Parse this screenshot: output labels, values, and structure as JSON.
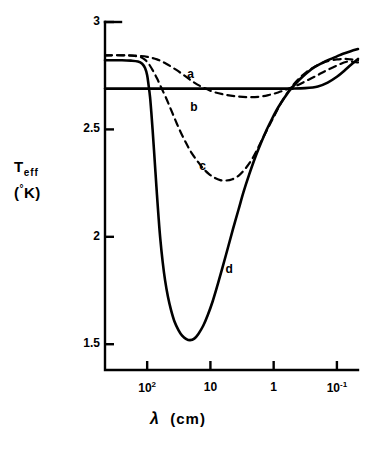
{
  "chart_data": {
    "type": "line",
    "title": "",
    "xlabel": "λ  (cm)",
    "ylabel": "T_eff (°K)",
    "xscale": "log",
    "x_axis_reversed": true,
    "xlim": [
      464.16,
      0.0464
    ],
    "ylim": [
      1.38,
      3.0
    ],
    "grid": false,
    "legend_position": "inline-curve-labels",
    "xticks": [
      {
        "value": 100,
        "label_base": "10",
        "label_exp": "2"
      },
      {
        "value": 10,
        "label_base": "10",
        "label_exp": ""
      },
      {
        "value": 1,
        "label_base": "1",
        "label_exp": ""
      },
      {
        "value": 0.1,
        "label_base": "10",
        "label_exp": "-1"
      }
    ],
    "yticks": [
      {
        "value": 3,
        "label": "3"
      },
      {
        "value": 2.5,
        "label": "2.5"
      },
      {
        "value": 2,
        "label": "2"
      },
      {
        "value": 1.5,
        "label": "1.5"
      }
    ],
    "series": [
      {
        "name": "a",
        "label": "a",
        "style": "solid",
        "label_x": 20,
        "label_y": 2.755,
        "points": [
          [
            464.16,
            2.69
          ],
          [
            100,
            2.69
          ],
          [
            30,
            2.69
          ],
          [
            10,
            2.69
          ],
          [
            3,
            2.69
          ],
          [
            1,
            2.69
          ],
          [
            0.5,
            2.69
          ],
          [
            0.32,
            2.692
          ],
          [
            0.2,
            2.7
          ],
          [
            0.14,
            2.718
          ],
          [
            0.1,
            2.745
          ],
          [
            0.075,
            2.775
          ],
          [
            0.0605,
            2.8
          ],
          [
            0.0464,
            2.828
          ]
        ]
      },
      {
        "name": "b",
        "label": "b",
        "style": "dashed",
        "label_x": 18,
        "label_y": 2.6,
        "points": [
          [
            464.16,
            2.845
          ],
          [
            200,
            2.845
          ],
          [
            140,
            2.843
          ],
          [
            100,
            2.838
          ],
          [
            70,
            2.826
          ],
          [
            50,
            2.806
          ],
          [
            35,
            2.778
          ],
          [
            25,
            2.748
          ],
          [
            18,
            2.718
          ],
          [
            13,
            2.695
          ],
          [
            9,
            2.675
          ],
          [
            6,
            2.662
          ],
          [
            4,
            2.654
          ],
          [
            2.6,
            2.65
          ],
          [
            1.7,
            2.652
          ],
          [
            1.2,
            2.66
          ],
          [
            0.85,
            2.672
          ],
          [
            0.6,
            2.688
          ],
          [
            0.42,
            2.706
          ],
          [
            0.3,
            2.727
          ],
          [
            0.21,
            2.75
          ],
          [
            0.15,
            2.773
          ],
          [
            0.1,
            2.797
          ],
          [
            0.07,
            2.815
          ],
          [
            0.0464,
            2.812
          ]
        ]
      },
      {
        "name": "c",
        "label": "c",
        "style": "dashed",
        "label_x": 13,
        "label_y": 2.325,
        "points": [
          [
            464.16,
            2.845
          ],
          [
            250,
            2.845
          ],
          [
            170,
            2.843
          ],
          [
            130,
            2.838
          ],
          [
            110,
            2.826
          ],
          [
            95,
            2.806
          ],
          [
            82,
            2.776
          ],
          [
            70,
            2.738
          ],
          [
            60,
            2.695
          ],
          [
            50,
            2.645
          ],
          [
            42,
            2.592
          ],
          [
            35,
            2.536
          ],
          [
            29,
            2.482
          ],
          [
            24,
            2.434
          ],
          [
            20,
            2.392
          ],
          [
            16,
            2.352
          ],
          [
            13,
            2.318
          ],
          [
            10.5,
            2.292
          ],
          [
            8.5,
            2.274
          ],
          [
            7,
            2.264
          ],
          [
            5.6,
            2.262
          ],
          [
            4.5,
            2.268
          ],
          [
            3.6,
            2.284
          ],
          [
            2.9,
            2.312
          ],
          [
            2.3,
            2.352
          ],
          [
            1.85,
            2.402
          ],
          [
            1.5,
            2.456
          ],
          [
            1.2,
            2.512
          ],
          [
            0.95,
            2.57
          ],
          [
            0.76,
            2.625
          ],
          [
            0.6,
            2.672
          ],
          [
            0.48,
            2.71
          ],
          [
            0.38,
            2.742
          ],
          [
            0.3,
            2.768
          ],
          [
            0.23,
            2.79
          ],
          [
            0.18,
            2.806
          ],
          [
            0.14,
            2.818
          ],
          [
            0.1,
            2.826
          ],
          [
            0.075,
            2.828
          ],
          [
            0.0605,
            2.826
          ],
          [
            0.0464,
            2.822
          ]
        ]
      },
      {
        "name": "d",
        "label": "d",
        "style": "solid",
        "label_x": 5.0,
        "label_y": 1.845,
        "points": [
          [
            464.16,
            2.822
          ],
          [
            250,
            2.822
          ],
          [
            180,
            2.82
          ],
          [
            140,
            2.816
          ],
          [
            120,
            2.806
          ],
          [
            108,
            2.786
          ],
          [
            100,
            2.752
          ],
          [
            95,
            2.706
          ],
          [
            90,
            2.65
          ],
          [
            86,
            2.58
          ],
          [
            82,
            2.498
          ],
          [
            78,
            2.404
          ],
          [
            74,
            2.302
          ],
          [
            70,
            2.196
          ],
          [
            66,
            2.09
          ],
          [
            62,
            1.99
          ],
          [
            57,
            1.886
          ],
          [
            52,
            1.796
          ],
          [
            47,
            1.722
          ],
          [
            42,
            1.66
          ],
          [
            37,
            1.606
          ],
          [
            32,
            1.566
          ],
          [
            28,
            1.54
          ],
          [
            24,
            1.524
          ],
          [
            21,
            1.519
          ],
          [
            18,
            1.526
          ],
          [
            15.5,
            1.548
          ],
          [
            13,
            1.586
          ],
          [
            11,
            1.636
          ],
          [
            9.2,
            1.7
          ],
          [
            7.7,
            1.776
          ],
          [
            6.4,
            1.86
          ],
          [
            5.3,
            1.948
          ],
          [
            4.4,
            2.036
          ],
          [
            3.6,
            2.126
          ],
          [
            3.0,
            2.208
          ],
          [
            2.45,
            2.288
          ],
          [
            2.0,
            2.362
          ],
          [
            1.6,
            2.434
          ],
          [
            1.3,
            2.496
          ],
          [
            1.05,
            2.552
          ],
          [
            0.85,
            2.602
          ],
          [
            0.68,
            2.646
          ],
          [
            0.55,
            2.684
          ],
          [
            0.44,
            2.716
          ],
          [
            0.35,
            2.745
          ],
          [
            0.28,
            2.77
          ],
          [
            0.22,
            2.792
          ],
          [
            0.17,
            2.81
          ],
          [
            0.13,
            2.826
          ],
          [
            0.1,
            2.84
          ],
          [
            0.08,
            2.852
          ],
          [
            0.0605,
            2.864
          ],
          [
            0.0464,
            2.874
          ]
        ]
      }
    ],
    "colors": {
      "axis": "#000000",
      "curve": "#000000",
      "background": "#ffffff"
    }
  },
  "axis_titles": {
    "y_main": "T",
    "y_sub": "eff",
    "y_unit_open": "(",
    "y_unit_deg": "°",
    "y_unit_k": "K",
    "y_unit_close": ")",
    "x_symbol": "λ",
    "x_unit": "(cm)"
  }
}
